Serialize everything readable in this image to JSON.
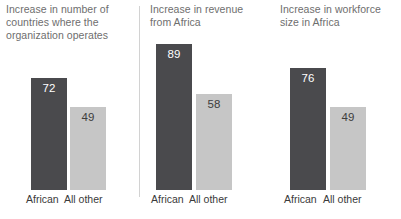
{
  "chart_data": {
    "type": "bar",
    "title": "",
    "categories": [
      "African",
      "All other"
    ],
    "series": [
      {
        "name": "Increase in number of countries where the organization operates",
        "values": [
          72,
          49
        ]
      },
      {
        "name": "Increase in revenue from Africa",
        "values": [
          89,
          58
        ]
      },
      {
        "name": "Increase in workforce size in Africa",
        "values": [
          76,
          49
        ]
      }
    ],
    "xlabel": "",
    "ylabel": "",
    "ylim": [
      0,
      100
    ],
    "grid": false,
    "legend": "none",
    "colors": {
      "african": "#4a4a4d",
      "all_other": "#c6c6c6",
      "title_text": "#6e6e6e",
      "axis_text": "#3a3a3a",
      "divider": "#d2d2d2",
      "background": "#ffffff"
    }
  },
  "panels": [
    {
      "title": "Increase in number of countries where the organization operates",
      "bars": [
        {
          "category": "African",
          "value": "72"
        },
        {
          "category": "All other",
          "value": "49"
        }
      ]
    },
    {
      "title": "Increase in revenue from Africa",
      "bars": [
        {
          "category": "African",
          "value": "89"
        },
        {
          "category": "All other",
          "value": "58"
        }
      ]
    },
    {
      "title": "Increase in workforce size in Africa",
      "bars": [
        {
          "category": "African",
          "value": "76"
        },
        {
          "category": "All other",
          "value": "49"
        }
      ]
    }
  ]
}
